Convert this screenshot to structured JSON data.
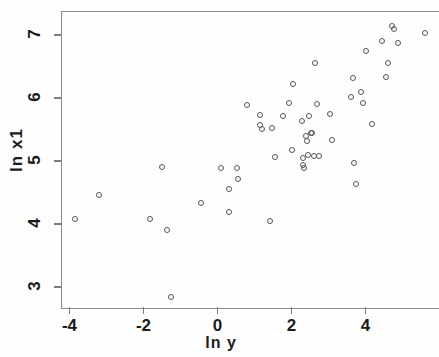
{
  "chart_data": {
    "type": "scatter",
    "title": "",
    "xlabel": "ln y",
    "ylabel": "ln x1",
    "xlim": [
      -4.75,
      5.95
    ],
    "ylim": [
      2.69,
      7.38
    ],
    "xticks": [
      -4,
      -2,
      0,
      2,
      4
    ],
    "xtick_labels": [
      "-4",
      "-2",
      "0",
      "2",
      "4"
    ],
    "yticks": [
      3,
      4,
      5,
      6,
      7
    ],
    "ytick_labels": [
      "3",
      "4",
      "5",
      "6",
      "7"
    ],
    "grid": false,
    "legend": null,
    "marker": "open-circle",
    "marker_color": "#55555c",
    "n_points": 64,
    "points": [
      {
        "x": -3.85,
        "y": 4.08
      },
      {
        "x": -3.2,
        "y": 4.46
      },
      {
        "x": -1.82,
        "y": 4.08
      },
      {
        "x": -1.5,
        "y": 4.9
      },
      {
        "x": -1.36,
        "y": 3.91
      },
      {
        "x": -1.26,
        "y": 2.84
      },
      {
        "x": -0.45,
        "y": 4.33
      },
      {
        "x": 0.09,
        "y": 4.89
      },
      {
        "x": 0.31,
        "y": 4.56
      },
      {
        "x": 0.31,
        "y": 4.19
      },
      {
        "x": 0.53,
        "y": 4.89
      },
      {
        "x": 0.55,
        "y": 4.72
      },
      {
        "x": 0.8,
        "y": 5.89
      },
      {
        "x": 1.14,
        "y": 5.73
      },
      {
        "x": 1.15,
        "y": 5.57
      },
      {
        "x": 1.2,
        "y": 5.51
      },
      {
        "x": 1.42,
        "y": 4.05
      },
      {
        "x": 1.47,
        "y": 5.52
      },
      {
        "x": 1.55,
        "y": 5.07
      },
      {
        "x": 1.76,
        "y": 5.71
      },
      {
        "x": 1.92,
        "y": 5.92
      },
      {
        "x": 2.02,
        "y": 5.18
      },
      {
        "x": 2.04,
        "y": 6.22
      },
      {
        "x": 2.28,
        "y": 5.63
      },
      {
        "x": 2.3,
        "y": 5.05
      },
      {
        "x": 2.32,
        "y": 4.93
      },
      {
        "x": 2.33,
        "y": 4.89
      },
      {
        "x": 2.38,
        "y": 5.4
      },
      {
        "x": 2.42,
        "y": 5.32
      },
      {
        "x": 2.45,
        "y": 5.09
      },
      {
        "x": 2.48,
        "y": 5.71
      },
      {
        "x": 2.52,
        "y": 5.45
      },
      {
        "x": 2.55,
        "y": 5.44
      },
      {
        "x": 2.6,
        "y": 5.08
      },
      {
        "x": 2.63,
        "y": 6.55
      },
      {
        "x": 2.7,
        "y": 5.9
      },
      {
        "x": 2.75,
        "y": 5.08
      },
      {
        "x": 3.05,
        "y": 5.74
      },
      {
        "x": 3.1,
        "y": 5.34
      },
      {
        "x": 3.62,
        "y": 6.02
      },
      {
        "x": 3.66,
        "y": 6.32
      },
      {
        "x": 3.7,
        "y": 4.97
      },
      {
        "x": 3.75,
        "y": 4.64
      },
      {
        "x": 3.88,
        "y": 6.1
      },
      {
        "x": 3.92,
        "y": 5.92
      },
      {
        "x": 4.0,
        "y": 6.74
      },
      {
        "x": 4.18,
        "y": 5.58
      },
      {
        "x": 4.45,
        "y": 6.9
      },
      {
        "x": 4.55,
        "y": 6.33
      },
      {
        "x": 4.6,
        "y": 6.55
      },
      {
        "x": 4.72,
        "y": 7.15
      },
      {
        "x": 4.78,
        "y": 7.1
      },
      {
        "x": 4.88,
        "y": 6.87
      },
      {
        "x": 5.62,
        "y": 7.03
      }
    ]
  },
  "axes": {
    "x_pixel_origin": 217.5,
    "x_pixels_per_unit": 37,
    "y_pixel_origin": 287,
    "y_pixels_per_unit": 63
  }
}
